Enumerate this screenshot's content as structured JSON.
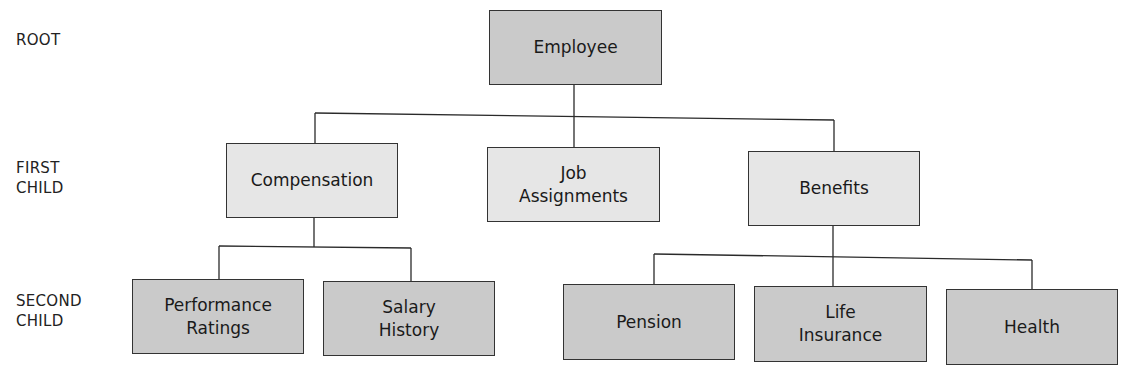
{
  "levels": {
    "root": [
      "ROOT"
    ],
    "first_child": [
      "FIRST",
      "CHILD"
    ],
    "second_child": [
      "SECOND",
      "CHILD"
    ]
  },
  "nodes": {
    "employee": {
      "lines": [
        "Employee"
      ]
    },
    "compensation": {
      "lines": [
        "Compensation"
      ]
    },
    "job_assignments": {
      "lines": [
        "Job",
        "Assignments"
      ]
    },
    "benefits": {
      "lines": [
        "Benefits"
      ]
    },
    "performance_ratings": {
      "lines": [
        "Performance",
        "Ratings"
      ]
    },
    "salary_history": {
      "lines": [
        "Salary",
        "History"
      ]
    },
    "pension": {
      "lines": [
        "Pension"
      ]
    },
    "life_insurance": {
      "lines": [
        "Life",
        "Insurance"
      ]
    },
    "health": {
      "lines": [
        "Health"
      ]
    }
  },
  "colors": {
    "root_and_second_level_fill": "#cacaca",
    "first_level_fill": "#e6e6e6",
    "border": "#333333"
  }
}
